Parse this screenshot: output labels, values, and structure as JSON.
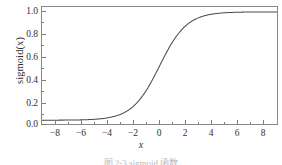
{
  "figure": {
    "background": "#ffffff",
    "frame_color": "#8a8a8a",
    "caption_partial": "图 2-3  sigmoid 函数"
  },
  "chart_data": {
    "type": "line",
    "title": "",
    "xlabel": "x",
    "ylabel": "sigmoid(x)",
    "xlim": [
      -8.6,
      8.6
    ],
    "ylim": [
      -0.035,
      1.045
    ],
    "grid": false,
    "legend": null,
    "line_color": "#4a4a4a",
    "line_width": 1.0,
    "xticks": [
      -8,
      -6,
      -4,
      -2,
      0,
      2,
      4,
      6,
      8
    ],
    "xtick_labels": [
      "−8",
      "−6",
      "−4",
      "−2",
      "0",
      "2",
      "4",
      "6",
      "8"
    ],
    "yticks": [
      0.0,
      0.2,
      0.4,
      0.6,
      0.8,
      1.0
    ],
    "ytick_labels": [
      "0.0",
      "0.2",
      "0.4",
      "0.6",
      "0.8",
      "1.0"
    ],
    "x": [
      -8.0,
      -7.5,
      -7.0,
      -6.5,
      -6.0,
      -5.5,
      -5.0,
      -4.5,
      -4.0,
      -3.5,
      -3.0,
      -2.5,
      -2.0,
      -1.5,
      -1.0,
      -0.5,
      0.0,
      0.5,
      1.0,
      1.5,
      2.0,
      2.5,
      3.0,
      3.5,
      4.0,
      4.5,
      5.0,
      5.5,
      6.0,
      6.5,
      7.0,
      7.5,
      8.0
    ],
    "y": [
      0.0003,
      0.0006,
      0.0009,
      0.0015,
      0.0025,
      0.0041,
      0.0067,
      0.011,
      0.018,
      0.0293,
      0.0474,
      0.0759,
      0.1192,
      0.1824,
      0.2689,
      0.3775,
      0.5,
      0.6225,
      0.7311,
      0.8176,
      0.8808,
      0.9241,
      0.9526,
      0.9707,
      0.982,
      0.989,
      0.9933,
      0.9959,
      0.9975,
      0.9985,
      0.9991,
      0.9994,
      0.9997
    ],
    "series_name": "sigmoid"
  }
}
